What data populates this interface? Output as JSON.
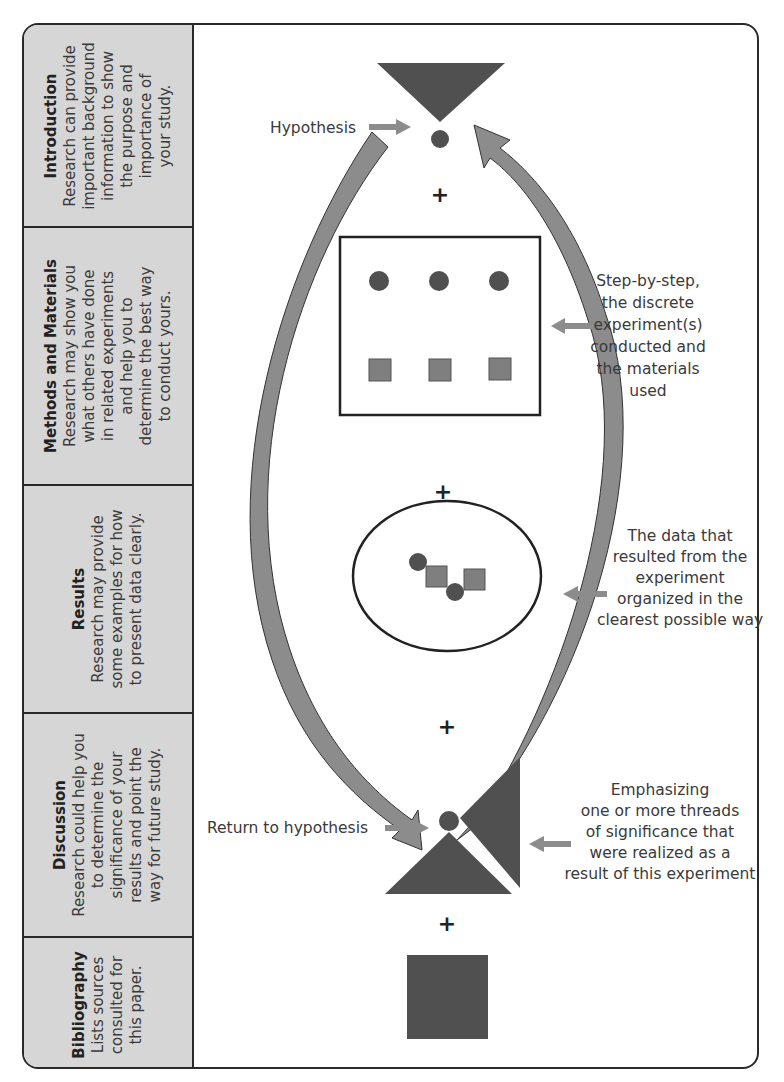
{
  "sidebar": {
    "sections": [
      {
        "heading": "Introduction",
        "lines": [
          "Research can provide",
          "important background",
          "information to show",
          "the purpose and",
          "importance of",
          "your study."
        ]
      },
      {
        "heading": "Methods and Materials",
        "lines": [
          "Research may show you",
          "what others have done",
          "in related experiments",
          "and help you to",
          "determine the best way",
          "to conduct yours."
        ]
      },
      {
        "heading": "Results",
        "lines": [
          "Research may provide",
          "some examples for how",
          "to present data clearly."
        ]
      },
      {
        "heading": "Discussion",
        "lines": [
          "Research could help you",
          "to determine the",
          "significance of your",
          "results and point the",
          "way for future study."
        ]
      },
      {
        "heading": "Bibliography",
        "lines": [
          "Lists sources",
          "consulted for",
          "this paper."
        ]
      }
    ]
  },
  "diagram": {
    "hypothesis_label": "Hypothesis",
    "plus_sign": "+",
    "methods_note": [
      "Step-by-step,",
      "the discrete",
      "experiment(s)",
      "conducted and",
      "the materials",
      "used"
    ],
    "results_note": [
      "The data that",
      "resulted from the",
      "experiment",
      "organized in the",
      "clearest possible way"
    ],
    "return_label": "Return to hypothesis",
    "discussion_note": [
      "Emphasizing",
      "one or more threads",
      "of significance that",
      "were realized as a",
      "result of this experiment"
    ]
  },
  "colors": {
    "dark_shape": "#505050",
    "medium_shape": "#7f7f7f",
    "arrow_fill": "#8c8c8c",
    "sidebar_bg": "#d6d6d6",
    "border": "#2a2a2a"
  }
}
